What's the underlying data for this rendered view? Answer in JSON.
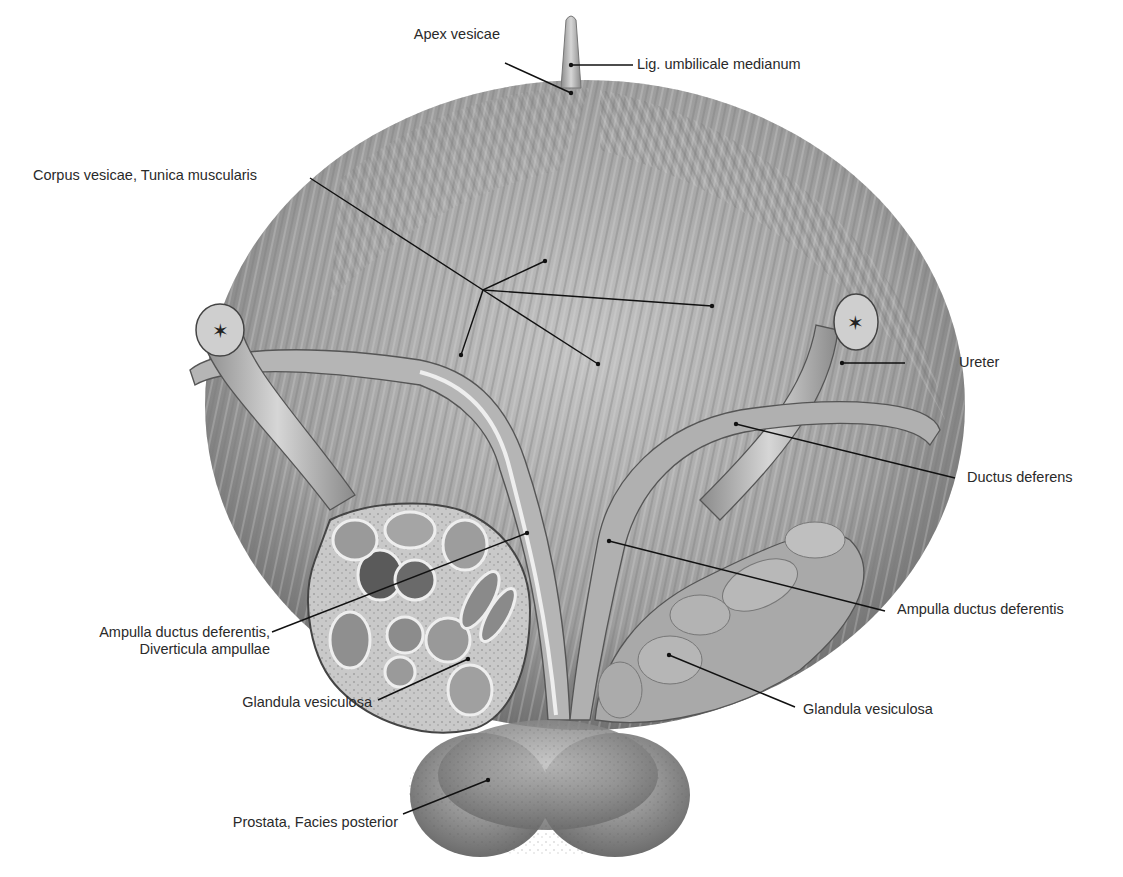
{
  "figure": {
    "colors": {
      "background": "#ffffff",
      "tissue_light": "#cfcfcf",
      "tissue_mid": "#9a9a9a",
      "tissue_dark": "#555555",
      "leader": "#111111",
      "text": "#2a2a2a"
    }
  },
  "labels": [
    {
      "id": "apex-vesicae",
      "text": "Apex vesicae"
    },
    {
      "id": "lig-umbilicale-medianum",
      "text": "Lig. umbilicale medianum"
    },
    {
      "id": "corpus-vesicae",
      "text": "Corpus vesicae, Tunica muscularis"
    },
    {
      "id": "ureter",
      "text": "Ureter"
    },
    {
      "id": "ductus-deferens",
      "text": "Ductus deferens"
    },
    {
      "id": "ampulla-ductus-deferentis-right",
      "text": "Ampulla ductus deferentis"
    },
    {
      "id": "ampulla-diverticula-line1",
      "text": "Ampulla ductus deferentis,"
    },
    {
      "id": "ampulla-diverticula-line2",
      "text": "Diverticula ampullae"
    },
    {
      "id": "glandula-vesiculosa-left",
      "text": "Glandula vesiculosa"
    },
    {
      "id": "glandula-vesiculosa-right",
      "text": "Glandula vesiculosa"
    },
    {
      "id": "prostata",
      "text": "Prostata, Facies posterior"
    }
  ]
}
